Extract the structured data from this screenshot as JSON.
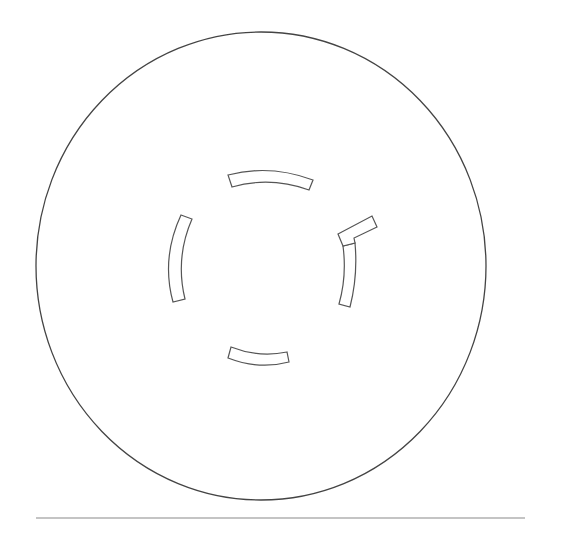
{
  "diagram": {
    "type": "circular-floor-plan-outline",
    "background_color": "#ffffff",
    "stroke_color": "#555555",
    "outer_circle": {
      "cx": 261,
      "cy": 266,
      "rx": 225,
      "ry": 234
    },
    "inner_segments": [
      {
        "name": "top-arc-segment",
        "path": "M228,175 Q270,164 313,180 L309,190 Q270,176 232,187 Z"
      },
      {
        "name": "right-arc-segment",
        "path": "M343,246 L355,243 Q358,276 350,307 L339,304 Q347,276 343,246 Z"
      },
      {
        "name": "right-tab-segment",
        "path": "M338,234 L372,216 L377,227 L354,238 L355,243 L343,246 Z"
      },
      {
        "name": "left-arc-segment",
        "path": "M181,215 L192,219 Q175,258 185,299 L173,302 Q161,258 181,215 Z"
      },
      {
        "name": "bottom-arc-segment",
        "path": "M231,347 Q259,358 287,352 L289,362 Q259,370 228,358 Z"
      }
    ],
    "divider_line": {
      "x1": 36,
      "y1": 518,
      "x2": 525,
      "y2": 518
    }
  }
}
